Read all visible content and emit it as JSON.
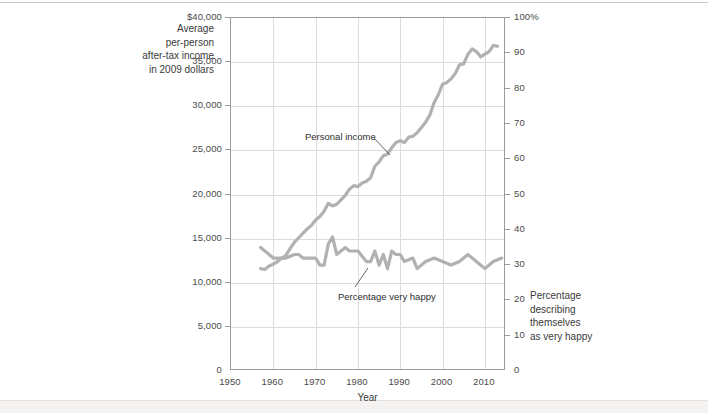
{
  "chart_data": {
    "type": "line",
    "title": "",
    "xlabel": "Year",
    "ylabel_left": "Average per-person after-tax income in 2009 dollars",
    "ylabel_right": "Percentage describing themselves as very happy",
    "xlim": [
      1950,
      2015
    ],
    "xticks": [
      1950,
      1960,
      1970,
      1980,
      1990,
      2000,
      2010
    ],
    "xticklabels": [
      "1950",
      "1960",
      "1970",
      "1980",
      "1990",
      "2000",
      "2010"
    ],
    "ylim_left": [
      0,
      40000
    ],
    "yticks_left": [
      0,
      5000,
      10000,
      15000,
      20000,
      25000,
      30000,
      35000,
      40000
    ],
    "yticklabels_left": [
      "0",
      "5,000",
      "10,000",
      "15,000",
      "20,000",
      "25,000",
      "30,000",
      "35,000",
      "$40,000"
    ],
    "ylim_right": [
      0,
      100
    ],
    "yticks_right": [
      0,
      10,
      20,
      30,
      40,
      50,
      60,
      70,
      80,
      90,
      100
    ],
    "yticklabels_right": [
      "0",
      "10",
      "20",
      "30",
      "40",
      "50",
      "60",
      "70",
      "80",
      "90",
      "100%"
    ],
    "grid": true,
    "legend": "annotations",
    "line_color": "#b3b1af",
    "series": [
      {
        "name": "Personal income",
        "axis": "left",
        "units": "2009 dollars per person",
        "x": [
          1957,
          1958,
          1959,
          1960,
          1961,
          1962,
          1963,
          1964,
          1965,
          1966,
          1967,
          1968,
          1969,
          1970,
          1971,
          1972,
          1973,
          1974,
          1975,
          1976,
          1977,
          1978,
          1979,
          1980,
          1981,
          1982,
          1983,
          1984,
          1985,
          1986,
          1987,
          1988,
          1989,
          1990,
          1991,
          1992,
          1993,
          1994,
          1995,
          1996,
          1997,
          1998,
          1999,
          2000,
          2001,
          2002,
          2003,
          2004,
          2005,
          2006,
          2007,
          2008,
          2009,
          2010,
          2011,
          2012,
          2013
        ],
        "values": [
          11600,
          11500,
          11900,
          12100,
          12400,
          12800,
          13100,
          13900,
          14600,
          15100,
          15600,
          16100,
          16500,
          17100,
          17500,
          18100,
          19000,
          18700,
          18900,
          19400,
          19900,
          20600,
          21000,
          20900,
          21300,
          21500,
          21900,
          23200,
          23700,
          24400,
          24600,
          25300,
          25900,
          26100,
          25900,
          26500,
          26600,
          27000,
          27600,
          28200,
          29000,
          30400,
          31300,
          32500,
          32700,
          33100,
          33700,
          34700,
          34800,
          35900,
          36500,
          36200,
          35600,
          35900,
          36200,
          36900,
          36800
        ]
      },
      {
        "name": "Percentage very happy",
        "axis": "right",
        "units": "percent",
        "x": [
          1957,
          1960,
          1963,
          1965,
          1966,
          1967,
          1970,
          1971,
          1972,
          1973,
          1974,
          1975,
          1976,
          1977,
          1978,
          1980,
          1982,
          1983,
          1984,
          1985,
          1986,
          1987,
          1988,
          1989,
          1990,
          1991,
          1993,
          1994,
          1996,
          1998,
          2000,
          2002,
          2004,
          2006,
          2008,
          2010,
          2012,
          2014
        ],
        "values": [
          35,
          32,
          32,
          33,
          33,
          32,
          32,
          30,
          30,
          36,
          38,
          33,
          34,
          35,
          34,
          34,
          31,
          31,
          34,
          30,
          33,
          29,
          34,
          33,
          33,
          31,
          32,
          29,
          31,
          32,
          31,
          30,
          31,
          33,
          31,
          29,
          31,
          32
        ]
      }
    ],
    "annotations": [
      {
        "text": "Personal income",
        "x_px": 305,
        "y_px": 131
      },
      {
        "text": "Percentage very happy",
        "x_px": 338,
        "y_px": 291
      }
    ]
  },
  "axes": {
    "left_title_lines": [
      "Average",
      "per-person",
      "after-tax income",
      "in 2009 dollars"
    ],
    "right_title_lines": [
      "Percentage",
      "describing",
      "themselves",
      "as very happy"
    ],
    "x_title": "Year"
  }
}
